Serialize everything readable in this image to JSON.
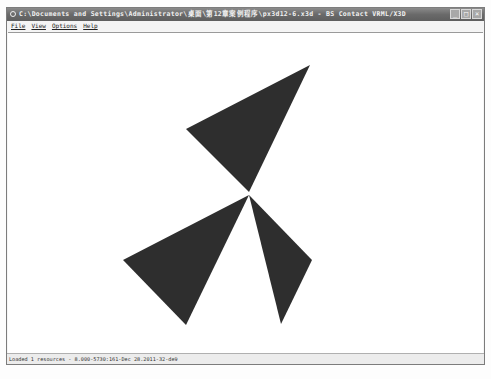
{
  "window": {
    "title": "C:\\Documents and Settings\\Administrator\\桌面\\第12章案例程序\\px3d12-6.x3d - BS Contact VRML/X3D",
    "controls": {
      "minimize": "_",
      "maximize": "□",
      "close": "×"
    }
  },
  "menu": {
    "items": [
      {
        "label": "File"
      },
      {
        "label": "View"
      },
      {
        "label": "Options"
      },
      {
        "label": "Help"
      }
    ]
  },
  "scene": {
    "fill_color": "#2e2e2e",
    "background": "#ffffff",
    "triangles": [
      {
        "name": "top",
        "points": "302,32 178,96 241,159"
      },
      {
        "name": "lower-left",
        "points": "241,162 115,227 178,292"
      },
      {
        "name": "lower-right",
        "points": "241,162 304,227 273,291"
      }
    ]
  },
  "status": {
    "text": "Loaded 1 resources  -  8.000-5730:161-Dec 28.2011-32-de9"
  }
}
